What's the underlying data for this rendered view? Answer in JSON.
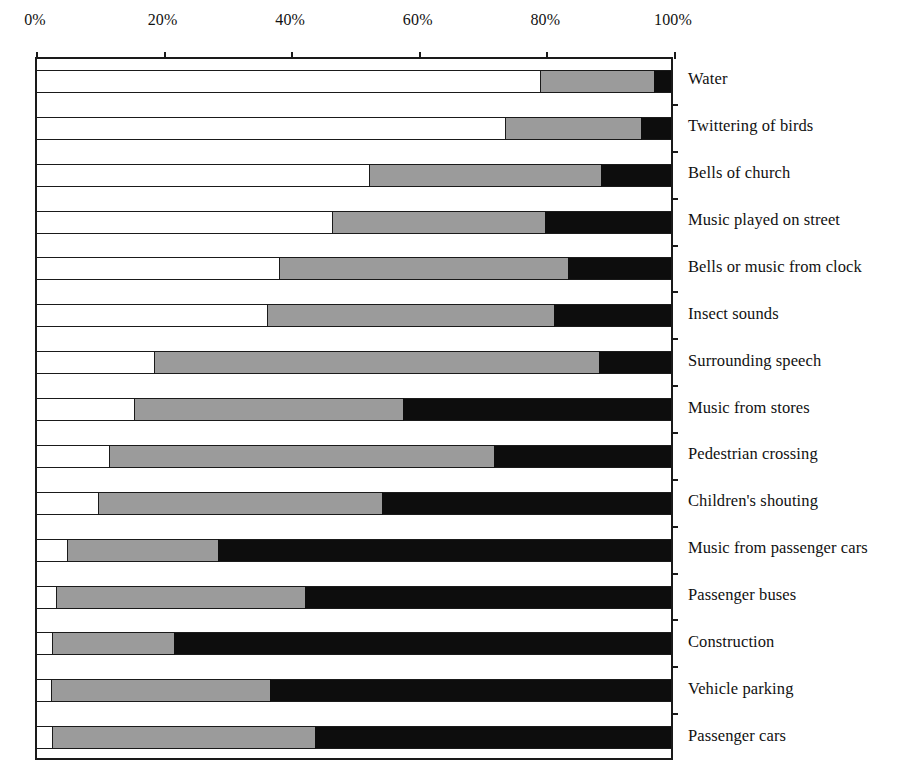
{
  "chart_data": {
    "type": "bar",
    "orientation": "horizontal",
    "stacked": true,
    "normalized": "100%",
    "title": "",
    "xlabel": "",
    "ylabel": "",
    "xlim": [
      0,
      100
    ],
    "grid": false,
    "legend_position": "none",
    "x_tick_labels": [
      "0%",
      "20%",
      "40%",
      "60%",
      "80%",
      "100%"
    ],
    "x_tick_values": [
      0,
      20,
      40,
      60,
      80,
      100
    ],
    "categories": [
      "Water",
      "Twittering of birds",
      "Bells of church",
      "Music played on street",
      "Bells or music from clock",
      "Insect sounds",
      "Surrounding speech",
      "Music from stores",
      "Pedestrian crossing",
      "Children's shouting",
      "Music from passenger cars",
      "Passenger buses",
      "Construction",
      "Vehicle parking",
      "Passenger cars"
    ],
    "series": [
      {
        "name": "white",
        "color": "#ffffff",
        "values": [
          79.4,
          73.8,
          52.4,
          46.5,
          38.2,
          36.2,
          18.4,
          15.3,
          11.3,
          9.7,
          4.7,
          3.0,
          2.4,
          2.2,
          2.4
        ]
      },
      {
        "name": "gray",
        "color": "#9b9b9b",
        "values": [
          17.9,
          21.5,
          36.6,
          33.7,
          45.6,
          45.3,
          70.2,
          42.5,
          60.8,
          44.7,
          23.8,
          39.2,
          19.2,
          34.6,
          41.4
        ]
      },
      {
        "name": "black",
        "color": "#0d0d0d",
        "values": [
          2.7,
          4.7,
          11.0,
          19.8,
          16.2,
          18.5,
          11.4,
          42.2,
          27.9,
          45.6,
          71.5,
          57.8,
          78.4,
          63.2,
          56.2
        ]
      }
    ],
    "cumulative_boundaries": {
      "white_end": [
        79.4,
        73.8,
        52.4,
        46.5,
        38.2,
        36.2,
        18.4,
        15.3,
        11.3,
        9.7,
        4.7,
        3.0,
        2.4,
        2.2,
        2.4
      ],
      "gray_end": [
        97.3,
        95.3,
        89.0,
        80.2,
        83.8,
        81.5,
        88.6,
        57.8,
        72.1,
        54.4,
        28.5,
        42.2,
        21.6,
        36.8,
        43.8
      ]
    }
  }
}
